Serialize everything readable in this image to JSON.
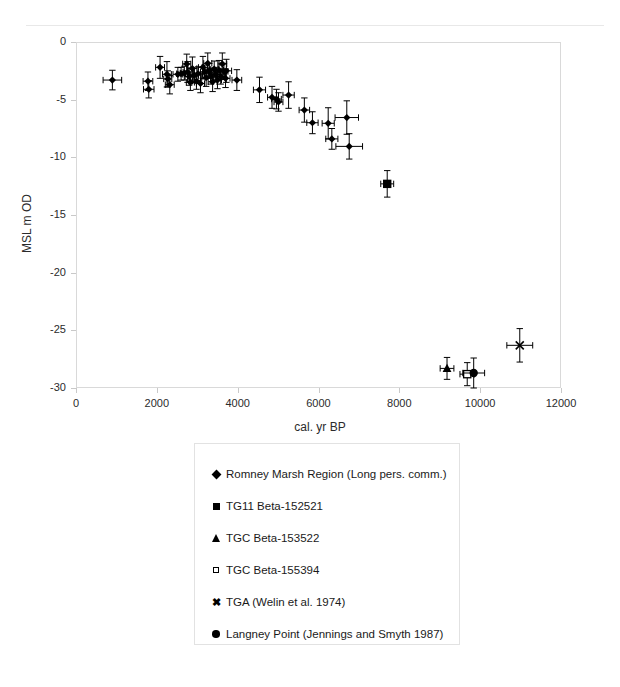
{
  "chart_data": {
    "type": "scatter",
    "title": "",
    "xlabel": "cal. yr BP",
    "ylabel": "MSL m OD",
    "xlim": [
      0,
      12000
    ],
    "ylim": [
      -30,
      0
    ],
    "xticks": [
      0,
      2000,
      4000,
      6000,
      8000,
      10000,
      12000
    ],
    "yticks": [
      0,
      -5,
      -10,
      -15,
      -20,
      -25,
      -30
    ],
    "xtick_labels": [
      "0",
      "2000",
      "4000",
      "6000",
      "8000",
      "10000",
      "12000"
    ],
    "ytick_labels": [
      "0",
      "-5",
      "-10",
      "-15",
      "-20",
      "-25",
      "-30"
    ],
    "grid": false,
    "legend_position": "below-plot",
    "error_bars": "x and y",
    "series": [
      {
        "name": "Romney Marsh Region (Long pers. comm.)",
        "marker": "diamond",
        "color": "#000000",
        "points": [
          {
            "x": 900,
            "y": -3.3,
            "xerr": 230,
            "yerr": 0.85
          },
          {
            "x": 1780,
            "y": -3.4,
            "xerr": 120,
            "yerr": 0.8
          },
          {
            "x": 1800,
            "y": -4.1,
            "xerr": 130,
            "yerr": 0.75
          },
          {
            "x": 2080,
            "y": -2.2,
            "xerr": 110,
            "yerr": 0.95
          },
          {
            "x": 2250,
            "y": -2.8,
            "xerr": 110,
            "yerr": 1.1
          },
          {
            "x": 2270,
            "y": -3.2,
            "xerr": 100,
            "yerr": 0.7
          },
          {
            "x": 2320,
            "y": -3.7,
            "xerr": 110,
            "yerr": 0.8
          },
          {
            "x": 2520,
            "y": -2.8,
            "xerr": 120,
            "yerr": 0.6
          },
          {
            "x": 2600,
            "y": -2.75,
            "xerr": 110,
            "yerr": 0.55
          },
          {
            "x": 2680,
            "y": -2.7,
            "xerr": 100,
            "yerr": 0.6
          },
          {
            "x": 2740,
            "y": -1.9,
            "xerr": 100,
            "yerr": 0.85
          },
          {
            "x": 2760,
            "y": -2.6,
            "xerr": 110,
            "yerr": 0.9
          },
          {
            "x": 2800,
            "y": -3.0,
            "xerr": 100,
            "yerr": 0.75
          },
          {
            "x": 2830,
            "y": -3.5,
            "xerr": 100,
            "yerr": 0.7
          },
          {
            "x": 2880,
            "y": -2.3,
            "xerr": 110,
            "yerr": 1.0
          },
          {
            "x": 2930,
            "y": -2.9,
            "xerr": 100,
            "yerr": 0.65
          },
          {
            "x": 2980,
            "y": -3.4,
            "xerr": 100,
            "yerr": 0.7
          },
          {
            "x": 3020,
            "y": -2.75,
            "xerr": 110,
            "yerr": 0.6
          },
          {
            "x": 3080,
            "y": -3.6,
            "xerr": 100,
            "yerr": 0.8
          },
          {
            "x": 3140,
            "y": -2.2,
            "xerr": 110,
            "yerr": 0.95
          },
          {
            "x": 3180,
            "y": -2.6,
            "xerr": 100,
            "yerr": 0.6
          },
          {
            "x": 3220,
            "y": -3.1,
            "xerr": 110,
            "yerr": 0.75
          },
          {
            "x": 3260,
            "y": -1.85,
            "xerr": 100,
            "yerr": 0.9
          },
          {
            "x": 3300,
            "y": -2.5,
            "xerr": 110,
            "yerr": 0.65
          },
          {
            "x": 3340,
            "y": -2.95,
            "xerr": 100,
            "yerr": 0.7
          },
          {
            "x": 3380,
            "y": -3.45,
            "xerr": 110,
            "yerr": 0.85
          },
          {
            "x": 3420,
            "y": -2.35,
            "xerr": 100,
            "yerr": 0.7
          },
          {
            "x": 3460,
            "y": -2.8,
            "xerr": 110,
            "yerr": 0.6
          },
          {
            "x": 3500,
            "y": -3.3,
            "xerr": 100,
            "yerr": 0.75
          },
          {
            "x": 3540,
            "y": -2.45,
            "xerr": 110,
            "yerr": 0.85
          },
          {
            "x": 3580,
            "y": -3.0,
            "xerr": 100,
            "yerr": 0.65
          },
          {
            "x": 3620,
            "y": -1.9,
            "xerr": 110,
            "yerr": 0.95
          },
          {
            "x": 3660,
            "y": -2.55,
            "xerr": 100,
            "yerr": 0.7
          },
          {
            "x": 3700,
            "y": -3.15,
            "xerr": 110,
            "yerr": 0.8
          },
          {
            "x": 3720,
            "y": -2.5,
            "xerr": 130,
            "yerr": 1.0
          },
          {
            "x": 3980,
            "y": -3.3,
            "xerr": 120,
            "yerr": 0.9
          },
          {
            "x": 4540,
            "y": -4.15,
            "xerr": 150,
            "yerr": 1.1
          },
          {
            "x": 4850,
            "y": -4.8,
            "xerr": 110,
            "yerr": 0.95
          },
          {
            "x": 4960,
            "y": -4.95,
            "xerr": 120,
            "yerr": 0.85
          },
          {
            "x": 5010,
            "y": -5.2,
            "xerr": 110,
            "yerr": 0.8
          },
          {
            "x": 5260,
            "y": -4.6,
            "xerr": 140,
            "yerr": 1.15
          },
          {
            "x": 5650,
            "y": -5.9,
            "xerr": 130,
            "yerr": 1.05
          },
          {
            "x": 5850,
            "y": -7.0,
            "xerr": 140,
            "yerr": 0.95
          },
          {
            "x": 6240,
            "y": -7.05,
            "xerr": 150,
            "yerr": 1.35
          },
          {
            "x": 6330,
            "y": -8.4,
            "xerr": 150,
            "yerr": 0.9
          },
          {
            "x": 6700,
            "y": -6.55,
            "xerr": 290,
            "yerr": 1.45
          },
          {
            "x": 6760,
            "y": -9.05,
            "xerr": 330,
            "yerr": 1.1
          }
        ]
      },
      {
        "name": "TG11 Beta-152521",
        "marker": "square-filled",
        "color": "#000000",
        "points": [
          {
            "x": 7700,
            "y": -12.3,
            "xerr": 160,
            "yerr": 1.15
          }
        ]
      },
      {
        "name": "TGC Beta-153522",
        "marker": "triangle",
        "color": "#000000",
        "points": [
          {
            "x": 9180,
            "y": -28.3,
            "xerr": 170,
            "yerr": 0.95
          }
        ]
      },
      {
        "name": "TGC Beta-155394",
        "marker": "square-open",
        "color": "#000000",
        "points": [
          {
            "x": 9680,
            "y": -28.8,
            "xerr": 180,
            "yerr": 1.0
          }
        ]
      },
      {
        "name": "TGA (Welin et al. 1974)",
        "marker": "x",
        "color": "#000000",
        "points": [
          {
            "x": 10980,
            "y": -26.3,
            "xerr": 320,
            "yerr": 1.45
          }
        ]
      },
      {
        "name": "Langney Point (Jennings and Smyth 1987)",
        "marker": "circle",
        "color": "#000000",
        "points": [
          {
            "x": 9840,
            "y": -28.7,
            "xerr": 270,
            "yerr": 1.3
          }
        ]
      }
    ]
  },
  "legend": {
    "entries": [
      {
        "marker": "diamond",
        "label": "Romney Marsh Region (Long pers. comm.)"
      },
      {
        "marker": "square-filled",
        "label": "TG11 Beta-152521"
      },
      {
        "marker": "triangle",
        "label": "TGC Beta-153522"
      },
      {
        "marker": "square-open",
        "label": "TGC Beta-155394"
      },
      {
        "marker": "x",
        "label": "TGA (Welin et al. 1974)"
      },
      {
        "marker": "circle",
        "label": "Langney Point (Jennings and Smyth 1987)"
      }
    ]
  }
}
